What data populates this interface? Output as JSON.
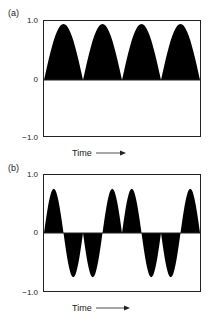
{
  "chart_data": [
    {
      "type": "area",
      "panel_label": "(a)",
      "title": "",
      "xlabel": "Time",
      "ylabel": "",
      "yticks": [
        "1.0",
        "0",
        "−1.0"
      ],
      "ylim": [
        -1.0,
        1.0
      ],
      "grid": false,
      "description": "Rectified sinusoid: four positive humps, no negative values",
      "humps": [
        {
          "index": 1,
          "sign": 1,
          "peak": 0.95
        },
        {
          "index": 2,
          "sign": 1,
          "peak": 0.95
        },
        {
          "index": 3,
          "sign": 1,
          "peak": 0.95
        },
        {
          "index": 4,
          "sign": 1,
          "peak": 0.95
        }
      ]
    },
    {
      "type": "area",
      "panel_label": "(b)",
      "title": "",
      "xlabel": "Time",
      "ylabel": "",
      "yticks": [
        "1.0",
        "0",
        "−1.0"
      ],
      "ylim": [
        -1.0,
        1.0
      ],
      "grid": false,
      "description": "Half-cycles alternating in a beat pattern: +, -, -, +, +, -, -, +",
      "humps": [
        {
          "index": 1,
          "sign": 1,
          "peak": 0.75
        },
        {
          "index": 2,
          "sign": -1,
          "peak": 0.75
        },
        {
          "index": 3,
          "sign": -1,
          "peak": 0.75
        },
        {
          "index": 4,
          "sign": 1,
          "peak": 0.75
        },
        {
          "index": 5,
          "sign": 1,
          "peak": 0.75
        },
        {
          "index": 6,
          "sign": -1,
          "peak": 0.75
        },
        {
          "index": 7,
          "sign": -1,
          "peak": 0.75
        },
        {
          "index": 8,
          "sign": 1,
          "peak": 0.75
        }
      ]
    }
  ],
  "panels": {
    "a": {
      "label": "(a)",
      "ytick_top": "1.0",
      "ytick_mid": "0",
      "ytick_bottom": "−1.0",
      "xlabel": "Time"
    },
    "b": {
      "label": "(b)",
      "ytick_top": "1.0",
      "ytick_mid": "0",
      "ytick_bottom": "−1.0",
      "xlabel": "Time"
    }
  },
  "colors": {
    "fill": "#000000",
    "axis": "#222222"
  }
}
